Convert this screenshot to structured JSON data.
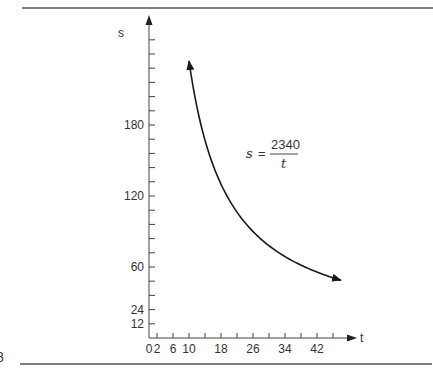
{
  "page": {
    "page_number_fragment": "8"
  },
  "chart_data": {
    "type": "line",
    "title": "",
    "xlabel": "t",
    "ylabel": "s",
    "equation": {
      "lhs": "s",
      "equals": "=",
      "numerator": "2340",
      "denominator": "t"
    },
    "x_ticks": [
      2,
      6,
      10,
      14,
      18,
      22,
      26,
      30,
      34,
      38,
      42,
      46
    ],
    "x_tick_labels": [
      "0",
      "2",
      "6",
      "10",
      "18",
      "26",
      "34",
      "42"
    ],
    "x_tick_label_values": [
      0,
      2,
      6,
      10,
      18,
      26,
      34,
      42
    ],
    "y_ticks": [
      12,
      24,
      36,
      48,
      60,
      72,
      84,
      96,
      108,
      120,
      132,
      144,
      156,
      168,
      180,
      192,
      204,
      216,
      228,
      240,
      252
    ],
    "y_tick_labels": [
      "12",
      "24",
      "60",
      "120",
      "180"
    ],
    "y_tick_label_values": [
      12,
      24,
      60,
      120,
      180
    ],
    "xlim": [
      0,
      50
    ],
    "ylim": [
      0,
      265
    ],
    "grid": false,
    "legend": null,
    "series": [
      {
        "name": "s = 2340/t",
        "function": "2340/t",
        "t_range": [
          10,
          48
        ],
        "x": [
          10,
          12,
          14,
          16,
          18,
          20,
          22,
          24,
          26,
          28,
          30,
          32,
          34,
          36,
          38,
          40,
          42,
          44,
          46,
          48
        ],
        "values": [
          234,
          195,
          167.1,
          146.3,
          130,
          117,
          106.4,
          97.5,
          90,
          83.6,
          78,
          73.1,
          68.8,
          65,
          61.6,
          58.5,
          55.7,
          53.2,
          50.9,
          48.75
        ],
        "arrows_at_both_ends": true
      }
    ]
  }
}
